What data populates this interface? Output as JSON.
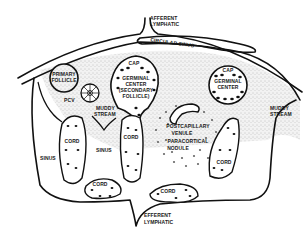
{
  "diagram": {
    "labels": {
      "afferent_lymphatic": [
        "AFFERENT",
        "LYMPHATIC"
      ],
      "circular_sinus": "CIRCULAR SINUS",
      "primary_follicle": [
        "PRIMARY",
        "FOLLICLE"
      ],
      "pcv": "PCV",
      "cap_left": "CAP",
      "germinal_center_left": [
        "GERMINAL",
        "CENTER",
        "(SECONDARY",
        "FOLLICLE)"
      ],
      "cap_right": "CAP",
      "germinal_center_right": [
        "GERMINAL",
        "CENTER"
      ],
      "muddy_stream_left": [
        "MUDDY",
        "STREAM"
      ],
      "muddy_stream_right": [
        "MUDDY",
        "STREAM"
      ],
      "cord_1": "CORD",
      "cord_2": "CORD",
      "cord_3": "CORD",
      "cord_4": "CORD",
      "cord_5": "CORD",
      "sinus_left": "SINUS",
      "sinus_middle": "SINUS",
      "postcapillary_venule": [
        "POSTCAPILLARY",
        "VENULE"
      ],
      "paracortical_nodule": [
        "PARACORTICAL",
        "NODULE"
      ],
      "efferent_lymphatic": [
        "EFFERENT",
        "LYMPHATIC"
      ]
    },
    "colors": {
      "ink": "#111111",
      "background": "#ffffff",
      "stipple": "#8a8a8a"
    }
  }
}
